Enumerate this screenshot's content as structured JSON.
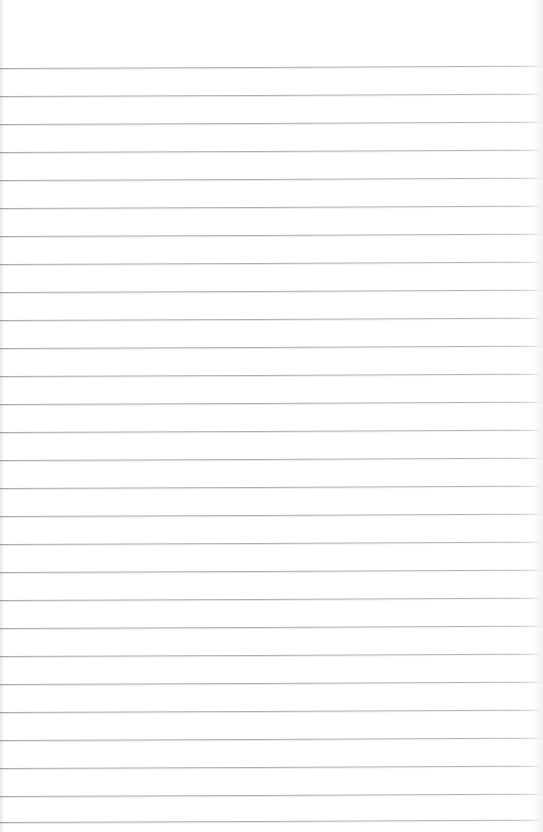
{
  "document": {
    "kind": "scanned-blank-ruled-notebook-page",
    "title": "Blank Ruled Notebook Page",
    "has_text_content": false,
    "has_handwriting": false,
    "has_margin_line": false,
    "has_header": false,
    "has_page_number": false,
    "body_text": ""
  },
  "page": {
    "width": 543,
    "height": 832,
    "background_color": "#ffffff",
    "paper_tone": "#fdfdfd",
    "orientation": "portrait"
  },
  "ruling": {
    "line_color": "#a9adb1",
    "line_color_faded": "#dcdee0",
    "line_thickness": 1,
    "line_count": 28,
    "first_line_y": 68,
    "line_spacing": 28,
    "left_inset": 0,
    "right_extent": 543,
    "skew_degrees": -0.25,
    "top_margin": 68,
    "line_y_positions": [
      68,
      96,
      124,
      152,
      180,
      208,
      236,
      264,
      292,
      320,
      348,
      376,
      404,
      432,
      460,
      488,
      516,
      544,
      572,
      600,
      628,
      656,
      684,
      712,
      740,
      768,
      796,
      822
    ]
  },
  "edges": {
    "left_shade_color": "#aaaeb2",
    "right_shade_color": "#babec2"
  }
}
